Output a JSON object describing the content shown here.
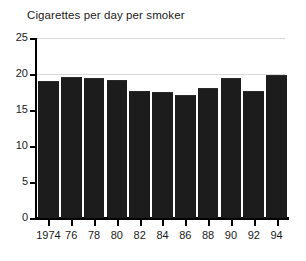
{
  "chart_data": {
    "type": "bar",
    "title": "Cigarettes per day per smoker",
    "xlabel": "",
    "ylabel": "",
    "categories": [
      "1974",
      "76",
      "78",
      "80",
      "82",
      "84",
      "86",
      "88",
      "90",
      "92",
      "94"
    ],
    "values": [
      19.0,
      19.6,
      19.4,
      19.2,
      17.7,
      17.5,
      17.1,
      18.0,
      19.4,
      17.7,
      19.9
    ],
    "ylim": [
      0,
      25
    ],
    "yticks": [
      0,
      5,
      10,
      15,
      20,
      25
    ],
    "ytick_labels": [
      "0",
      "5",
      "10",
      "15",
      "20",
      "25"
    ],
    "grid": "horizontal-light",
    "gridlines_at": [
      20,
      25
    ],
    "legend": "none",
    "bar_color": "#1c1c1c",
    "axis_color": "#000000",
    "grid_color": "#d8d8d8",
    "background": "#ffffff"
  }
}
